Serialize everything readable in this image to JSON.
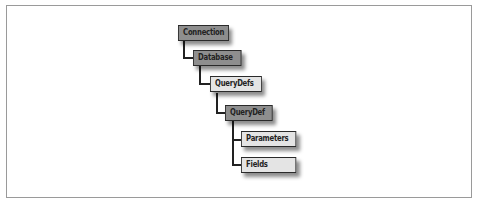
{
  "diagram": {
    "type": "object-hierarchy",
    "nodes": [
      {
        "id": "connection",
        "label": "Connection",
        "style": "dark"
      },
      {
        "id": "database",
        "label": "Database",
        "style": "dark"
      },
      {
        "id": "querydefs",
        "label": "QueryDefs",
        "style": "light"
      },
      {
        "id": "querydef",
        "label": "QueryDef",
        "style": "dark"
      },
      {
        "id": "parameters",
        "label": "Parameters",
        "style": "light"
      },
      {
        "id": "fields",
        "label": "Fields",
        "style": "light"
      }
    ],
    "edges": [
      [
        "connection",
        "database"
      ],
      [
        "database",
        "querydefs"
      ],
      [
        "querydefs",
        "querydef"
      ],
      [
        "querydef",
        "parameters"
      ],
      [
        "querydef",
        "fields"
      ]
    ],
    "colors": {
      "dark_fill": "#8e8e8e",
      "light_fill": "#e4e4e4",
      "border": "#2a2a2a",
      "frame": "#9a9a9a"
    }
  },
  "caption": {
    "text": "",
    "truncated": true
  }
}
